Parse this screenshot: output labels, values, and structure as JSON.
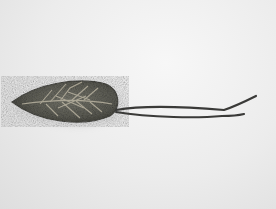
{
  "image": {
    "subject": "Woven leaf-shaped object with two dark cords on light background",
    "colors": {
      "background": "#ececec",
      "leaf_body": "#6a6a62",
      "leaf_edge": "#4a4a44",
      "veins": "#b8b2a0",
      "cord": "#3a3a38"
    }
  }
}
